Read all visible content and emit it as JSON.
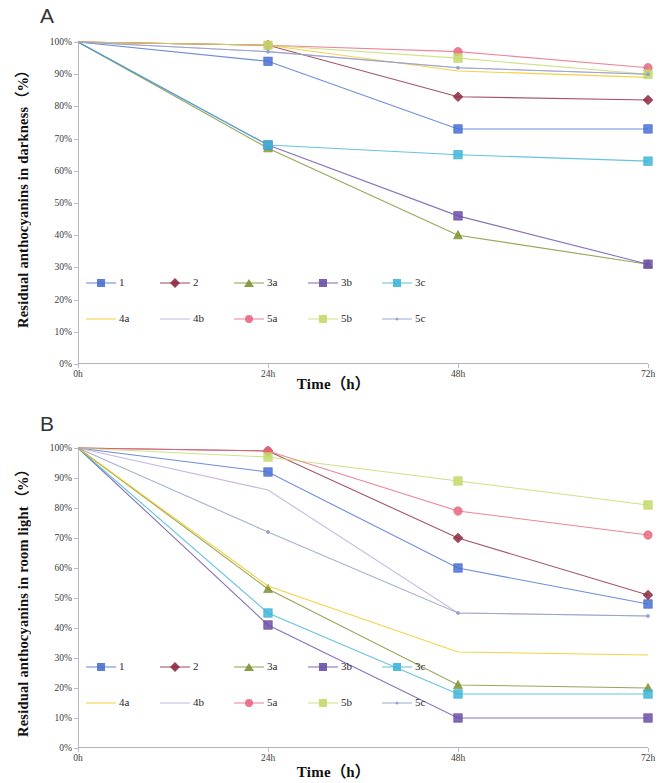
{
  "figure": {
    "panels": [
      {
        "letter": "A",
        "ytitle": "Residual anthocyanins in darkness（%）",
        "xtitle": "Time（h）"
      },
      {
        "letter": "B",
        "ytitle": "Residual anthocyanins in room light（%）",
        "xtitle": "Time（h）"
      }
    ],
    "y_ticks": [
      "0%",
      "10%",
      "20%",
      "30%",
      "40%",
      "50%",
      "60%",
      "70%",
      "80%",
      "90%",
      "100%"
    ],
    "x_ticks": [
      "0h",
      "24h",
      "48h",
      "72h"
    ],
    "legend_rows": [
      [
        "1",
        "2",
        "3a",
        "3b",
        "3c"
      ],
      [
        "4a",
        "4b",
        "5a",
        "5b",
        "5c"
      ]
    ],
    "colors": {
      "1": "#4a6fd4",
      "2": "#8e2840",
      "3a": "#7d9130",
      "3b": "#6b4fa8",
      "3c": "#3fb5d8",
      "4a": "#f2c618",
      "4b": "#b9a7dd",
      "5a": "#e8687f",
      "5b": "#c3d96a",
      "5c": "#8e9fc4"
    },
    "markers": {
      "1": "square",
      "2": "diamond",
      "3a": "triangle",
      "3b": "square",
      "3c": "square",
      "4a": "none",
      "4b": "none",
      "5a": "circle",
      "5b": "square",
      "5c": "dot"
    }
  },
  "chart_data": [
    {
      "type": "line",
      "title": "A",
      "xlabel": "Time（h）",
      "ylabel": "Residual anthocyanins in darkness（%）",
      "categories": [
        "0h",
        "24h",
        "48h",
        "72h"
      ],
      "x": [
        0,
        24,
        48,
        72
      ],
      "ylim": [
        0,
        100
      ],
      "grid": false,
      "legend_position": "inside-bottom-left",
      "series": [
        {
          "name": "1",
          "values": [
            100,
            94,
            73,
            73
          ]
        },
        {
          "name": "2",
          "values": [
            100,
            99,
            83,
            82
          ]
        },
        {
          "name": "3a",
          "values": [
            100,
            67,
            40,
            31
          ]
        },
        {
          "name": "3b",
          "values": [
            100,
            68,
            46,
            31
          ]
        },
        {
          "name": "3c",
          "values": [
            100,
            68,
            65,
            63
          ]
        },
        {
          "name": "4a",
          "values": [
            100,
            99,
            91,
            89
          ]
        },
        {
          "name": "4b",
          "values": [
            100,
            97,
            92,
            90
          ]
        },
        {
          "name": "5a",
          "values": [
            100,
            99,
            97,
            92
          ]
        },
        {
          "name": "5b",
          "values": [
            100,
            99,
            95,
            90
          ]
        },
        {
          "name": "5c",
          "values": [
            100,
            97,
            92,
            90
          ]
        }
      ]
    },
    {
      "type": "line",
      "title": "B",
      "xlabel": "Time（h）",
      "ylabel": "Residual anthocyanins in room light（%）",
      "categories": [
        "0h",
        "24h",
        "48h",
        "72h"
      ],
      "x": [
        0,
        24,
        48,
        72
      ],
      "ylim": [
        0,
        100
      ],
      "grid": false,
      "legend_position": "inside-bottom-left",
      "series": [
        {
          "name": "1",
          "values": [
            100,
            92,
            60,
            48
          ]
        },
        {
          "name": "2",
          "values": [
            100,
            99,
            70,
            51
          ]
        },
        {
          "name": "3a",
          "values": [
            100,
            53,
            21,
            20
          ]
        },
        {
          "name": "3b",
          "values": [
            100,
            41,
            10,
            10
          ]
        },
        {
          "name": "3c",
          "values": [
            100,
            45,
            18,
            18
          ]
        },
        {
          "name": "4a",
          "values": [
            100,
            54,
            32,
            31
          ]
        },
        {
          "name": "4b",
          "values": [
            100,
            86,
            45,
            44
          ]
        },
        {
          "name": "5a",
          "values": [
            100,
            99,
            79,
            71
          ]
        },
        {
          "name": "5b",
          "values": [
            100,
            97,
            89,
            81
          ]
        },
        {
          "name": "5c",
          "values": [
            100,
            72,
            45,
            44
          ]
        }
      ]
    }
  ]
}
